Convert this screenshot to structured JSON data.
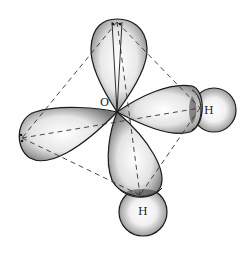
{
  "diagram": {
    "labels": {
      "oxygen": "O",
      "hydrogen_right": "H",
      "hydrogen_bottom": "H"
    },
    "components": [
      {
        "name": "lone-pair-lobe-top",
        "type": "sp3 lobe"
      },
      {
        "name": "lone-pair-lobe-left",
        "type": "sp3 lobe"
      },
      {
        "name": "bonding-lobe-right",
        "type": "sp3 lobe"
      },
      {
        "name": "bonding-lobe-bottom",
        "type": "sp3 lobe"
      },
      {
        "name": "hydrogen-sphere-right",
        "type": "1s orbital"
      },
      {
        "name": "hydrogen-sphere-bottom",
        "type": "1s orbital"
      },
      {
        "name": "tetrahedron-outline",
        "type": "dashed edges"
      }
    ],
    "colors": {
      "outline": "#1a1a1a",
      "shade_dark": "#7a7a7a",
      "shade_light": "#ffffff",
      "dash": "#333333"
    }
  }
}
